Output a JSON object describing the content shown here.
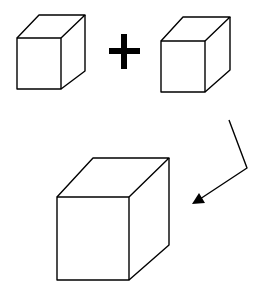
{
  "diagram": {
    "operator": "+",
    "colors": {
      "stroke": "#000000",
      "background": "#ffffff"
    },
    "elements": [
      {
        "id": "cube-small-left",
        "shape": "cube"
      },
      {
        "id": "plus-sign",
        "shape": "plus"
      },
      {
        "id": "cube-small-right",
        "shape": "cube"
      },
      {
        "id": "arrow-bent",
        "shape": "arrow"
      },
      {
        "id": "cube-large",
        "shape": "cube"
      }
    ]
  }
}
